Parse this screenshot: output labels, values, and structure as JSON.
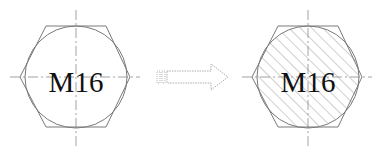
{
  "figure": {
    "left_label": "M16",
    "right_label": "M16",
    "arrow": "transition-arrow",
    "colors": {
      "line": "#7a7a7a",
      "center_line": "#8a8a8a",
      "hatch": "#a0a0a0",
      "text": "#111111",
      "background": "#ffffff"
    }
  }
}
